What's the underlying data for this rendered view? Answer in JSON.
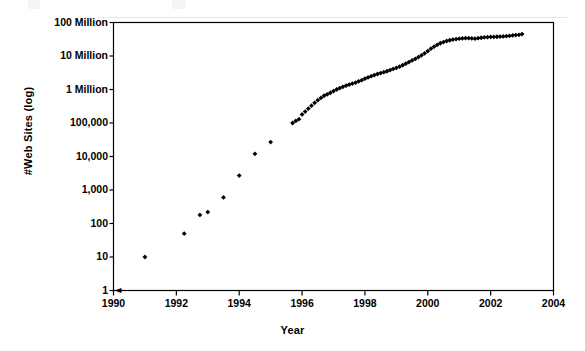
{
  "figure": {
    "background_color": "#ffffff",
    "axis_color": "#000000",
    "marker_color": "#000000"
  },
  "chart_data": {
    "type": "scatter",
    "title": "",
    "xlabel": "Year",
    "ylabel": "#Web Sites (log)",
    "yscale": "log",
    "xlim": [
      1990,
      2004
    ],
    "ylim": [
      1,
      100000000
    ],
    "grid": false,
    "legend": false,
    "legend_position": "none",
    "xticks": [
      1990,
      1992,
      1994,
      1996,
      1998,
      2000,
      2002,
      2004
    ],
    "xtick_labels": [
      "1990",
      "1992",
      "1994",
      "1996",
      "1998",
      "2000",
      "2002",
      "2004"
    ],
    "yticks": [
      1,
      10,
      100,
      1000,
      10000,
      100000,
      1000000,
      10000000,
      100000000
    ],
    "ytick_labels": [
      "1",
      "10",
      "100",
      "1,000",
      "10,000",
      "100,000",
      "1 Million",
      "10 Million",
      "100 Million"
    ],
    "marker": "diamond",
    "series": [
      {
        "name": "Number of Web Sites",
        "x": [
          1991.0,
          1992.25,
          1992.75,
          1993.0,
          1993.5,
          1994.0,
          1994.5,
          1995.0,
          1995.7,
          1995.8,
          1995.9,
          1996.0,
          1996.1,
          1996.2,
          1996.3,
          1996.4,
          1996.5,
          1996.6,
          1996.7,
          1996.8,
          1996.9,
          1997.0,
          1997.1,
          1997.2,
          1997.3,
          1997.4,
          1997.5,
          1997.6,
          1997.7,
          1997.8,
          1997.9,
          1998.0,
          1998.1,
          1998.2,
          1998.3,
          1998.4,
          1998.5,
          1998.6,
          1998.7,
          1998.8,
          1998.9,
          1999.0,
          1999.1,
          1999.2,
          1999.3,
          1999.4,
          1999.5,
          1999.6,
          1999.7,
          1999.8,
          1999.9,
          2000.0,
          2000.1,
          2000.2,
          2000.3,
          2000.4,
          2000.5,
          2000.6,
          2000.7,
          2000.8,
          2000.9,
          2001.0,
          2001.1,
          2001.2,
          2001.3,
          2001.4,
          2001.5,
          2001.6,
          2001.7,
          2001.8,
          2001.9,
          2002.0,
          2002.1,
          2002.2,
          2002.3,
          2002.4,
          2002.5,
          2002.6,
          2002.7,
          2002.8,
          2002.9,
          2003.0
        ],
        "y": [
          10,
          50,
          180,
          220,
          600,
          2700,
          12000,
          27000,
          100000,
          115000,
          130000,
          180000,
          220000,
          270000,
          330000,
          400000,
          480000,
          560000,
          650000,
          720000,
          800000,
          900000,
          1000000,
          1100000,
          1200000,
          1300000,
          1400000,
          1500000,
          1600000,
          1750000,
          1900000,
          2100000,
          2300000,
          2500000,
          2700000,
          2900000,
          3100000,
          3300000,
          3500000,
          3800000,
          4100000,
          4400000,
          4800000,
          5300000,
          5900000,
          6600000,
          7400000,
          8200000,
          9200000,
          10500000,
          12000000,
          14000000,
          16500000,
          19000000,
          21500000,
          24000000,
          26000000,
          28000000,
          29500000,
          31000000,
          32000000,
          33000000,
          33500000,
          34000000,
          34000000,
          33500000,
          33000000,
          34000000,
          35000000,
          36000000,
          36500000,
          37000000,
          37000000,
          37500000,
          38000000,
          38500000,
          39000000,
          40000000,
          41000000,
          42000000,
          43000000,
          45000000
        ]
      }
    ]
  }
}
